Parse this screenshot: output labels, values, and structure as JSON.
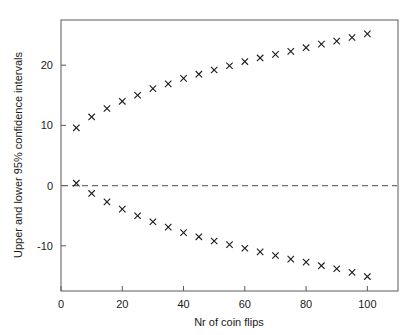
{
  "chart_data": {
    "type": "scatter",
    "title": "",
    "xlabel": "Nr of coin flips",
    "ylabel": "Upper and lower 95% confidence intervals",
    "xlim": [
      0,
      110
    ],
    "ylim": [
      -17.5,
      27.5
    ],
    "xticks": [
      0,
      20,
      40,
      60,
      80,
      100
    ],
    "xtick_labels": [
      "0",
      "20",
      "40",
      "60",
      "80",
      "100"
    ],
    "yticks": [
      -10,
      0,
      10,
      20
    ],
    "ytick_labels": [
      "-10",
      "0",
      "10",
      "20"
    ],
    "grid": false,
    "legend": "none",
    "marker": "x",
    "marker_color": "#1a1a1a",
    "reference_lines": [
      {
        "name": "zero-line",
        "axis": "y",
        "value": 0,
        "style": "dashed",
        "color": "#6e6e6e"
      }
    ],
    "x": [
      5,
      10,
      15,
      20,
      25,
      30,
      35,
      40,
      45,
      50,
      55,
      60,
      65,
      70,
      75,
      80,
      85,
      90,
      95,
      100
    ],
    "series": [
      {
        "name": "Upper 95% confidence interval",
        "values": [
          9.6,
          11.4,
          12.8,
          14.0,
          15.0,
          16.1,
          16.9,
          17.8,
          18.5,
          19.2,
          19.9,
          20.6,
          21.2,
          21.8,
          22.3,
          22.9,
          23.5,
          24.0,
          24.6,
          25.2
        ]
      },
      {
        "name": "Lower 95% confidence interval",
        "values": [
          0.4,
          -1.3,
          -2.7,
          -3.9,
          -5.0,
          -6.0,
          -6.9,
          -7.8,
          -8.5,
          -9.2,
          -9.8,
          -10.4,
          -11.0,
          -11.6,
          -12.2,
          -12.7,
          -13.3,
          -13.8,
          -14.4,
          -15.1
        ]
      }
    ]
  },
  "figure": {
    "background_color": "#ffffff",
    "axis_color": "#5a5a5a"
  }
}
